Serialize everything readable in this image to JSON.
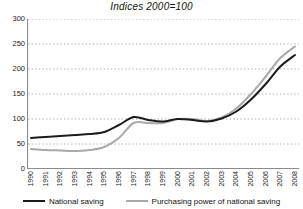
{
  "chart_data": {
    "type": "line",
    "title": "Indices 2000=100",
    "xlabel": "",
    "ylabel": "",
    "ylim": [
      0,
      300
    ],
    "yticks": [
      0,
      50,
      100,
      150,
      200,
      250,
      300
    ],
    "grid": "horizontal-dotted",
    "legend_position": "bottom",
    "categories": [
      "1990",
      "1991",
      "1992",
      "1993",
      "1994",
      "1995",
      "1996",
      "1997",
      "1998",
      "1999",
      "2000",
      "2001",
      "2002",
      "2003",
      "2004",
      "2005",
      "2006",
      "2007",
      "2008"
    ],
    "series": [
      {
        "name": "National saving",
        "color": "#1c1c1c",
        "values": [
          62,
          64,
          66,
          68,
          70,
          74,
          88,
          104,
          98,
          95,
          100,
          98,
          95,
          101,
          115,
          139,
          170,
          205,
          228
        ]
      },
      {
        "name": "Purchasing power of national saving",
        "color": "#a9a9a9",
        "values": [
          40,
          38,
          37,
          36,
          38,
          44,
          62,
          92,
          92,
          92,
          100,
          100,
          96,
          103,
          121,
          150,
          185,
          222,
          245
        ]
      }
    ]
  },
  "legend": {
    "entries": [
      {
        "label": "National saving"
      },
      {
        "label": "Purchasing power of national saving"
      }
    ]
  }
}
